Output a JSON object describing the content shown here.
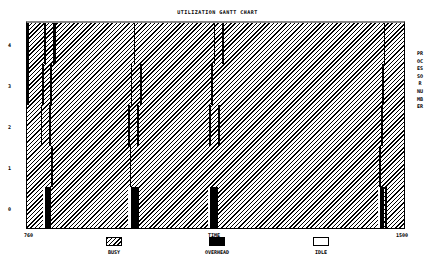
{
  "chart_data": {
    "type": "gantt",
    "title": "UTILIZATION GANTT CHART",
    "xlabel": "TIME",
    "ylabel": "PROCESSOR NUMBER",
    "x_tick_labels": [
      "760",
      "1500"
    ],
    "xlim": [
      760,
      1500
    ],
    "y_tick_labels": [
      "4",
      "3",
      "2",
      "1",
      "0"
    ],
    "processors": [
      0,
      1,
      2,
      3,
      4
    ],
    "legend": [
      {
        "state": "BUSY",
        "pattern": "diagonal-hatch"
      },
      {
        "state": "OVERHEAD",
        "pattern": "solid-black"
      },
      {
        "state": "IDLE",
        "pattern": "white"
      }
    ],
    "grid": false,
    "legend_position": "bottom",
    "note": "Processors are mostly BUSY; periodic synchronization phases appear as short OVERHEAD strips staggered across processors 4→0, with processor 0 showing IDLE followed by OVERHEAD blocks at roughly times 850, 1010, 1130, 1260 and 1470.",
    "segments": [
      {
        "processor": 4,
        "state": "OVERHEAD",
        "start": 760,
        "end": 762
      },
      {
        "processor": 3,
        "state": "OVERHEAD",
        "start": 760,
        "end": 762
      },
      {
        "processor": 4,
        "state": "OVERHEAD",
        "start": 794,
        "end": 796
      },
      {
        "processor": 4,
        "state": "OVERHEAD",
        "start": 811,
        "end": 816
      },
      {
        "processor": 3,
        "state": "OVERHEAD",
        "start": 790,
        "end": 792
      },
      {
        "processor": 3,
        "state": "OVERHEAD",
        "start": 806,
        "end": 808
      },
      {
        "processor": 2,
        "state": "OVERHEAD",
        "start": 787,
        "end": 789
      },
      {
        "processor": 2,
        "state": "OVERHEAD",
        "start": 804,
        "end": 806
      },
      {
        "processor": 1,
        "state": "OVERHEAD",
        "start": 808,
        "end": 810
      },
      {
        "processor": 0,
        "state": "IDLE",
        "start": 791,
        "end": 796
      },
      {
        "processor": 0,
        "state": "OVERHEAD",
        "start": 796,
        "end": 808
      },
      {
        "processor": 4,
        "state": "OVERHEAD",
        "start": 970,
        "end": 972
      },
      {
        "processor": 3,
        "state": "OVERHEAD",
        "start": 964,
        "end": 966
      },
      {
        "processor": 3,
        "state": "OVERHEAD",
        "start": 982,
        "end": 985
      },
      {
        "processor": 2,
        "state": "OVERHEAD",
        "start": 959,
        "end": 961
      },
      {
        "processor": 2,
        "state": "OVERHEAD",
        "start": 976,
        "end": 978
      },
      {
        "processor": 1,
        "state": "OVERHEAD",
        "start": 962,
        "end": 964
      },
      {
        "processor": 0,
        "state": "IDLE",
        "start": 958,
        "end": 965
      },
      {
        "processor": 0,
        "state": "OVERHEAD",
        "start": 965,
        "end": 979
      },
      {
        "processor": 4,
        "state": "OVERHEAD",
        "start": 1127,
        "end": 1129
      },
      {
        "processor": 4,
        "state": "OVERHEAD",
        "start": 1143,
        "end": 1146
      },
      {
        "processor": 3,
        "state": "OVERHEAD",
        "start": 1122,
        "end": 1124
      },
      {
        "processor": 2,
        "state": "OVERHEAD",
        "start": 1118,
        "end": 1120
      },
      {
        "processor": 2,
        "state": "OVERHEAD",
        "start": 1135,
        "end": 1138
      },
      {
        "processor": 0,
        "state": "IDLE",
        "start": 1116,
        "end": 1120
      },
      {
        "processor": 0,
        "state": "OVERHEAD",
        "start": 1120,
        "end": 1135
      },
      {
        "processor": 4,
        "state": "OVERHEAD",
        "start": 1460,
        "end": 1463
      },
      {
        "processor": 3,
        "state": "OVERHEAD",
        "start": 1457,
        "end": 1459
      },
      {
        "processor": 2,
        "state": "OVERHEAD",
        "start": 1455,
        "end": 1457
      },
      {
        "processor": 1,
        "state": "OVERHEAD",
        "start": 1451,
        "end": 1453
      },
      {
        "processor": 0,
        "state": "IDLE",
        "start": 1448,
        "end": 1453
      },
      {
        "processor": 0,
        "state": "OVERHEAD",
        "start": 1453,
        "end": 1460
      },
      {
        "processor": 0,
        "state": "OVERHEAD",
        "start": 1463,
        "end": 1466
      }
    ]
  },
  "labels": {
    "title": "UTILIZATION GANTT CHART",
    "x_start": "760",
    "x_end": "1500",
    "x_axis": "TIME",
    "y_axis": "PROCESSOR NUMBER",
    "y_ticks": [
      "4",
      "3",
      "2",
      "1",
      "0"
    ],
    "legend": [
      "BUSY",
      "OVERHEAD",
      "IDLE"
    ]
  }
}
